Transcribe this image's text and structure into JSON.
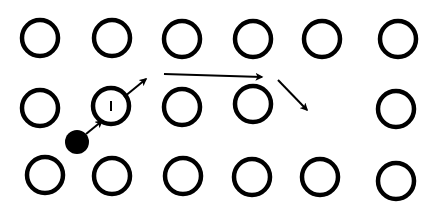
{
  "diagram": {
    "type": "lattice-vacancy-diffusion",
    "colors": {
      "stroke": "#000000",
      "background": "#ffffff",
      "interstitial": "#000000"
    },
    "atom_radius": 18,
    "atom_stroke_width": 4.5,
    "atoms": [
      {
        "row": 1,
        "x": 40,
        "y": 38
      },
      {
        "row": 1,
        "x": 112,
        "y": 38
      },
      {
        "row": 1,
        "x": 182,
        "y": 39
      },
      {
        "row": 1,
        "x": 253,
        "y": 39
      },
      {
        "row": 1,
        "x": 322,
        "y": 39
      },
      {
        "row": 1,
        "x": 398,
        "y": 39
      },
      {
        "row": 2,
        "x": 40,
        "y": 108
      },
      {
        "row": 2,
        "x": 111,
        "y": 106,
        "label": "I"
      },
      {
        "row": 2,
        "x": 182,
        "y": 107
      },
      {
        "row": 2,
        "x": 253,
        "y": 104
      },
      {
        "row": 2,
        "x": 396,
        "y": 109
      },
      {
        "row": 3,
        "x": 45,
        "y": 175
      },
      {
        "row": 3,
        "x": 112,
        "y": 176
      },
      {
        "row": 3,
        "x": 183,
        "y": 176
      },
      {
        "row": 3,
        "x": 252,
        "y": 177
      },
      {
        "row": 3,
        "x": 320,
        "y": 177
      },
      {
        "row": 3,
        "x": 396,
        "y": 181
      }
    ],
    "vacancy": {
      "x": 322,
      "y": 108
    },
    "interstitial": {
      "x": 77,
      "y": 142,
      "r": 12
    },
    "arrows": [
      {
        "from": [
          86,
          134
        ],
        "to": [
          102,
          121
        ]
      },
      {
        "from": [
          124,
          97
        ],
        "to": [
          146,
          79
        ]
      },
      {
        "from": [
          164,
          74
        ],
        "to": [
          262,
          77
        ]
      },
      {
        "from": [
          278,
          80
        ],
        "to": [
          307,
          110
        ]
      }
    ]
  }
}
